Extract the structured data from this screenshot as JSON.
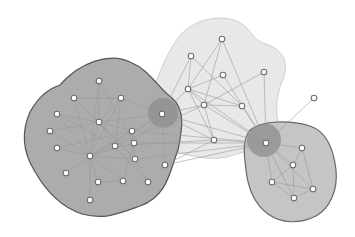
{
  "diagram": {
    "type": "network-community-graph",
    "width": 355,
    "height": 237,
    "colors": {
      "background": "#ffffff",
      "community_left_fill": "#a8a8a8",
      "community_left_stroke": "#555555",
      "community_top_fill": "#e6e6e6",
      "community_top_stroke": "#c4c4c4",
      "community_right_fill": "#c2c2c2",
      "community_right_stroke": "#666666",
      "overlap_fill": "#8c8c8c",
      "edge": "#9a9a9a",
      "node_fill": "#ffffff",
      "node_stroke": "#6e6e6e"
    },
    "communities": [
      {
        "id": "left",
        "path": "M 60 85 C 80 62, 110 52, 130 62 C 150 70, 158 88, 172 98 C 186 110, 182 130, 178 150 C 170 170, 168 196, 140 206 C 118 214, 104 220, 82 214 C 58 206, 44 188, 34 170 C 22 150, 22 130, 30 112 C 38 98, 46 90, 60 85 Z"
      },
      {
        "id": "top",
        "path": "M 178 38 C 190 22, 214 14, 234 20 C 252 26, 250 40, 266 44 C 284 50, 290 64, 282 82 C 276 96, 276 110, 278 122 C 280 134, 270 148, 252 150 C 232 154, 228 160, 206 158 C 188 156, 172 152, 160 142 C 150 134, 150 118, 152 100 C 154 84, 164 58, 178 38 Z"
      },
      {
        "id": "right",
        "path": "M 250 130 C 262 120, 290 120, 310 126 C 328 132, 334 152, 336 170 C 338 190, 330 208, 316 216 C 300 224, 282 224, 268 214 C 254 204, 248 188, 246 170 C 244 154, 242 140, 250 130 Z"
      }
    ],
    "overlaps": [
      {
        "id": "left-top",
        "cx": 163,
        "cy": 113,
        "r": 15
      },
      {
        "id": "top-right",
        "cx": 264,
        "cy": 140,
        "r": 17
      }
    ],
    "nodes": [
      {
        "id": 0,
        "x": 99,
        "y": 81
      },
      {
        "id": 1,
        "x": 74,
        "y": 98
      },
      {
        "id": 2,
        "x": 121,
        "y": 98
      },
      {
        "id": 3,
        "x": 57,
        "y": 114
      },
      {
        "id": 4,
        "x": 99,
        "y": 122
      },
      {
        "id": 5,
        "x": 162,
        "y": 114
      },
      {
        "id": 6,
        "x": 50,
        "y": 131
      },
      {
        "id": 7,
        "x": 132,
        "y": 131
      },
      {
        "id": 8,
        "x": 134,
        "y": 143
      },
      {
        "id": 9,
        "x": 115,
        "y": 146
      },
      {
        "id": 10,
        "x": 57,
        "y": 148
      },
      {
        "id": 11,
        "x": 90,
        "y": 156
      },
      {
        "id": 12,
        "x": 135,
        "y": 159
      },
      {
        "id": 13,
        "x": 165,
        "y": 165
      },
      {
        "id": 14,
        "x": 66,
        "y": 173
      },
      {
        "id": 15,
        "x": 98,
        "y": 182
      },
      {
        "id": 16,
        "x": 123,
        "y": 181
      },
      {
        "id": 17,
        "x": 148,
        "y": 182
      },
      {
        "id": 18,
        "x": 90,
        "y": 200
      },
      {
        "id": 19,
        "x": 222,
        "y": 39
      },
      {
        "id": 20,
        "x": 191,
        "y": 56
      },
      {
        "id": 21,
        "x": 223,
        "y": 75
      },
      {
        "id": 22,
        "x": 264,
        "y": 72
      },
      {
        "id": 23,
        "x": 188,
        "y": 89
      },
      {
        "id": 24,
        "x": 204,
        "y": 105
      },
      {
        "id": 25,
        "x": 242,
        "y": 106
      },
      {
        "id": 26,
        "x": 314,
        "y": 98
      },
      {
        "id": 27,
        "x": 214,
        "y": 140
      },
      {
        "id": 28,
        "x": 266,
        "y": 143
      },
      {
        "id": 29,
        "x": 302,
        "y": 148
      },
      {
        "id": 30,
        "x": 293,
        "y": 165
      },
      {
        "id": 31,
        "x": 272,
        "y": 182
      },
      {
        "id": 32,
        "x": 313,
        "y": 189
      },
      {
        "id": 33,
        "x": 294,
        "y": 198
      }
    ],
    "edges": [
      [
        0,
        4
      ],
      [
        1,
        4
      ],
      [
        2,
        4
      ],
      [
        3,
        4
      ],
      [
        6,
        4
      ],
      [
        4,
        11
      ],
      [
        4,
        9
      ],
      [
        4,
        7
      ],
      [
        4,
        5
      ],
      [
        4,
        12
      ],
      [
        1,
        2
      ],
      [
        2,
        5
      ],
      [
        0,
        11
      ],
      [
        1,
        11
      ],
      [
        3,
        11
      ],
      [
        6,
        11
      ],
      [
        10,
        11
      ],
      [
        14,
        11
      ],
      [
        15,
        11
      ],
      [
        16,
        11
      ],
      [
        18,
        11
      ],
      [
        9,
        11
      ],
      [
        11,
        7
      ],
      [
        11,
        8
      ],
      [
        11,
        12
      ],
      [
        11,
        5
      ],
      [
        11,
        2
      ],
      [
        9,
        17
      ],
      [
        15,
        16
      ],
      [
        7,
        12
      ],
      [
        8,
        16
      ],
      [
        12,
        17
      ],
      [
        5,
        13
      ],
      [
        5,
        9
      ],
      [
        5,
        8
      ],
      [
        3,
        9
      ],
      [
        10,
        7
      ],
      [
        2,
        9
      ],
      [
        1,
        12
      ],
      [
        0,
        8
      ],
      [
        5,
        23
      ],
      [
        5,
        20
      ],
      [
        5,
        24
      ],
      [
        5,
        27
      ],
      [
        5,
        28
      ],
      [
        23,
        19
      ],
      [
        23,
        20
      ],
      [
        23,
        21
      ],
      [
        23,
        24
      ],
      [
        23,
        27
      ],
      [
        23,
        28
      ],
      [
        23,
        25
      ],
      [
        20,
        25
      ],
      [
        19,
        24
      ],
      [
        19,
        28
      ],
      [
        21,
        28
      ],
      [
        22,
        28
      ],
      [
        22,
        24
      ],
      [
        24,
        25
      ],
      [
        24,
        28
      ],
      [
        24,
        27
      ],
      [
        25,
        28
      ],
      [
        27,
        28
      ],
      [
        26,
        28
      ],
      [
        8,
        28
      ],
      [
        7,
        28
      ],
      [
        12,
        28
      ],
      [
        9,
        24
      ],
      [
        13,
        28
      ],
      [
        13,
        27
      ],
      [
        9,
        27
      ],
      [
        28,
        29
      ],
      [
        28,
        30
      ],
      [
        28,
        31
      ],
      [
        28,
        33
      ],
      [
        28,
        32
      ],
      [
        29,
        30
      ],
      [
        29,
        32
      ],
      [
        30,
        31
      ],
      [
        30,
        33
      ],
      [
        31,
        32
      ],
      [
        32,
        33
      ],
      [
        31,
        33
      ]
    ]
  }
}
